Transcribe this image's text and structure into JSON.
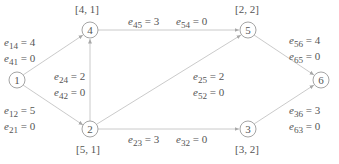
{
  "diagram": {
    "type": "directed network flow graph",
    "nodes": [
      {
        "id": "1",
        "label": "1",
        "x": 17,
        "y": 80,
        "annotation": ""
      },
      {
        "id": "2",
        "label": "2",
        "x": 90,
        "y": 129,
        "annotation": "[5, 1]"
      },
      {
        "id": "3",
        "label": "3",
        "x": 248,
        "y": 129,
        "annotation": "[3, 2]"
      },
      {
        "id": "4",
        "label": "4",
        "x": 90,
        "y": 30,
        "annotation": "[4, 1]"
      },
      {
        "id": "5",
        "label": "5",
        "x": 248,
        "y": 30,
        "annotation": "[2, 2]"
      },
      {
        "id": "6",
        "label": "6",
        "x": 321,
        "y": 80,
        "annotation": ""
      }
    ],
    "edges": [
      {
        "from": "1",
        "to": "4",
        "labels": [
          {
            "sub": "14",
            "val": "4"
          },
          {
            "sub": "41",
            "val": "0"
          }
        ]
      },
      {
        "from": "1",
        "to": "2",
        "labels": [
          {
            "sub": "12",
            "val": "5"
          },
          {
            "sub": "21",
            "val": "0"
          }
        ]
      },
      {
        "from": "2",
        "to": "4",
        "labels": [
          {
            "sub": "24",
            "val": "2"
          },
          {
            "sub": "42",
            "val": "0"
          }
        ]
      },
      {
        "from": "4",
        "to": "5",
        "labels": [
          {
            "sub": "45",
            "val": "3"
          },
          {
            "sub": "54",
            "val": "0"
          }
        ]
      },
      {
        "from": "2",
        "to": "5",
        "labels": [
          {
            "sub": "25",
            "val": "2"
          },
          {
            "sub": "52",
            "val": "0"
          }
        ]
      },
      {
        "from": "2",
        "to": "3",
        "labels": [
          {
            "sub": "23",
            "val": "3"
          },
          {
            "sub": "32",
            "val": "0"
          }
        ]
      },
      {
        "from": "5",
        "to": "6",
        "labels": [
          {
            "sub": "56",
            "val": "4"
          },
          {
            "sub": "65",
            "val": "0"
          }
        ]
      },
      {
        "from": "3",
        "to": "6",
        "labels": [
          {
            "sub": "36",
            "val": "3"
          },
          {
            "sub": "63",
            "val": "0"
          }
        ]
      }
    ],
    "label_prefix": "e",
    "equals": "=",
    "colors": {
      "line": "#bdbdbd",
      "node_stroke": "#9a9a9a",
      "text": "#555555"
    }
  }
}
